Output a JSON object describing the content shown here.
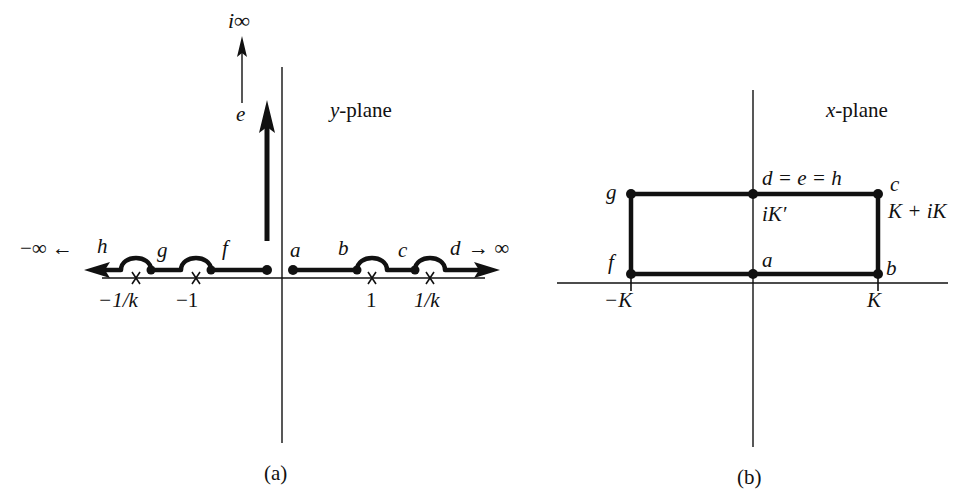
{
  "figure": {
    "panels": [
      {
        "id": "a",
        "caption": "(a)",
        "plane_label_var": "y",
        "plane_label_rest": "-plane",
        "top_label": "i∞",
        "vertical_arrow_label": "e",
        "left_end_label": "−∞ ←",
        "left_end_point": "h",
        "right_end_point": "d",
        "right_end_label": "→ ∞",
        "points_above": [
          "g",
          "f",
          "a",
          "b",
          "c"
        ],
        "tick_labels": [
          "−1/k",
          "−1",
          "1",
          "1/k"
        ],
        "branch_points": [
          -3,
          -1,
          1,
          3
        ]
      },
      {
        "id": "b",
        "caption": "(b)",
        "plane_label_var": "x",
        "plane_label_rest": "-plane",
        "top_center_label": "d = e = h",
        "top_center_value": "iK′",
        "top_left_point": "g",
        "top_right_point": "c",
        "top_right_value": "K + iK",
        "bottom_left_point": "f",
        "bottom_center_point": "a",
        "bottom_right_point": "b",
        "tick_labels": [
          "−K",
          "K"
        ]
      }
    ]
  },
  "style": {
    "ink": "#111111",
    "background": "#ffffff"
  }
}
